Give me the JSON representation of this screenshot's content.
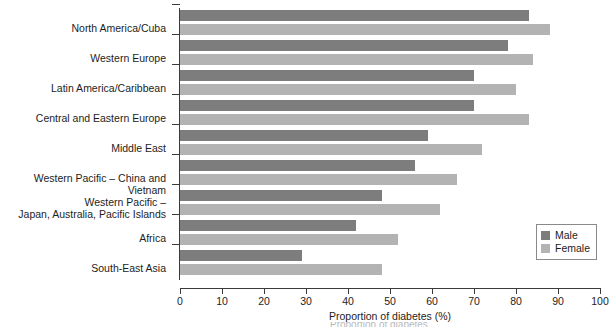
{
  "chart_data": {
    "type": "bar",
    "orientation": "horizontal",
    "title": "",
    "xlabel": "Proportion of diabetes (%)",
    "ylabel": "",
    "xlim": [
      0,
      100
    ],
    "xticks": [
      0,
      10,
      20,
      30,
      40,
      50,
      60,
      70,
      80,
      90,
      100
    ],
    "xtick_labels": [
      "0",
      "10",
      "20",
      "30",
      "40",
      "50",
      "60",
      "70",
      "80",
      "90",
      "100"
    ],
    "grid": false,
    "legend_position": "bottom-right",
    "categories": [
      "North America/Cuba",
      "Western Europe",
      "Latin America/Caribbean",
      "Central and Eastern Europe",
      "Middle East",
      "Western Pacific – China and Vietnam",
      "Western Pacific –\nJapan, Australia, Pacific Islands",
      "Africa",
      "South-East Asia"
    ],
    "series": [
      {
        "name": "Male",
        "color": "#7d7d7d",
        "values": [
          83,
          78,
          70,
          70,
          59,
          56,
          48,
          42,
          29
        ]
      },
      {
        "name": "Female",
        "color": "#b3b3b3",
        "values": [
          88,
          84,
          80,
          83,
          72,
          66,
          62,
          52,
          48
        ]
      }
    ]
  },
  "legend": {
    "items": [
      {
        "label": "Male",
        "color": "#7d7d7d"
      },
      {
        "label": "Female",
        "color": "#b3b3b3"
      }
    ]
  },
  "caption": {
    "text": "Proportion of diabetes"
  }
}
